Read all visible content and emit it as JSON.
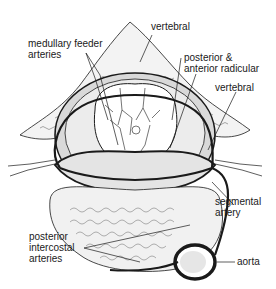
{
  "diagram": {
    "type": "anatomical-illustration",
    "labels": {
      "medullary_feeder_line1": "medullary feeder",
      "medullary_feeder_line2": "arteries",
      "vertebral_top": "vertebral",
      "radicular_line1": "posterior &",
      "radicular_line2": "anterior radicular",
      "vertebral_right": "vertebral",
      "segmental_line1": "segmental",
      "segmental_line2": "artery",
      "intercostal_line1": "posterior",
      "intercostal_line2": "intercostal",
      "intercostal_line3": "arteries",
      "aorta": "aorta"
    },
    "colors": {
      "ink": "#1a1a1a",
      "bone_fill": "#f2f2f2",
      "cord_fill": "#ffffff",
      "shade": "#cfcfcf"
    }
  }
}
